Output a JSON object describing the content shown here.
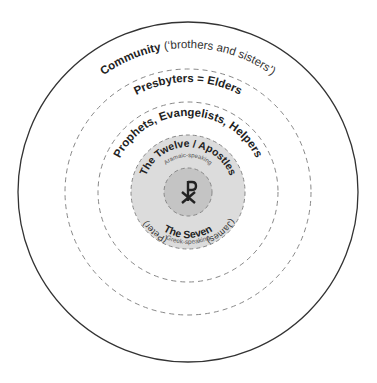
{
  "diagram": {
    "center": {
      "x": 188,
      "y": 192
    },
    "colors": {
      "background": "#ffffff",
      "outer_stroke": "#333333",
      "dashed_stroke": "#888888",
      "apostles_fill": "#dcdcdc",
      "core_fill": "#c4c4c4",
      "text": "#222222"
    },
    "rings": [
      {
        "id": "community",
        "radius": 170,
        "style": "solid",
        "label_bold": "Community",
        "label_normal": " (‘brothers and sisters’)"
      },
      {
        "id": "presbyters",
        "radius": 123,
        "style": "dashed",
        "label_bold": "Presbyters = Elders"
      },
      {
        "id": "prophets",
        "radius": 90,
        "style": "dashed",
        "label_bold": "Prophets, Evangelists, Helpers"
      },
      {
        "id": "apostles",
        "radius": 57,
        "style": "dashed-filled",
        "label_bold": "The Twelve / Apostles",
        "sublabel": "Aramaic-speaking",
        "left_label": "(Peter)",
        "right_label": "(James)",
        "bottom_label": "The Seven",
        "bottom_sublabel": "Greek-speaking"
      },
      {
        "id": "core",
        "radius": 24,
        "style": "dashed-filled",
        "symbol": "☧",
        "symbol_name": "chi-rho"
      }
    ]
  }
}
